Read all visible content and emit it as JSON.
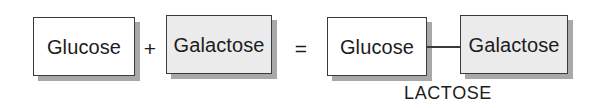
{
  "diagram": {
    "background_color": "#ffffff",
    "border_color": "#3a3a3a",
    "shadow_color": "#a8a8a8",
    "text_color": "#1c1c1c",
    "gray_fill_color": "#ebebeb",
    "white_fill_color": "#ffffff",
    "reactants": [
      {
        "id": "glucose-left",
        "label": "Glucose",
        "fill": "white"
      },
      {
        "id": "galactose-left",
        "label": "Galactose",
        "fill": "gray"
      }
    ],
    "products": [
      {
        "id": "glucose-right",
        "label": "Glucose",
        "fill": "white"
      },
      {
        "id": "galactose-right",
        "label": "Galactose",
        "fill": "gray"
      }
    ],
    "operators": [
      {
        "id": "plus",
        "symbol": "+",
        "name": "plus-operator"
      },
      {
        "id": "equals",
        "symbol": "=",
        "name": "equals-operator"
      }
    ],
    "bond": {
      "name": "glycosidic-bond-line"
    },
    "caption": {
      "text": "LACTOSE"
    }
  }
}
